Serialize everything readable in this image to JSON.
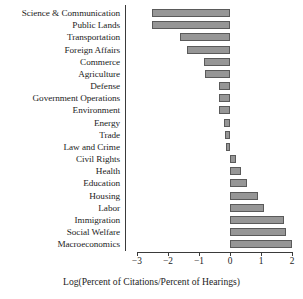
{
  "chart_data": {
    "type": "bar",
    "orientation": "horizontal",
    "title": "",
    "xlabel": "Log(Percent of Citations/Percent of Hearings)",
    "ylabel": "",
    "xlim": [
      -3.35,
      2.35
    ],
    "xticks": [
      -3,
      -2,
      -1,
      0,
      1,
      2
    ],
    "xtick_labels": [
      "−3",
      "−2",
      "−1",
      "0",
      "1",
      "2"
    ],
    "grid": false,
    "legend": null,
    "bar_color": "#969696",
    "bar_edge_color": "#5a5a5a",
    "axis_color": "#3a3a3a",
    "categories": [
      "Science & Communication",
      "Public Lands",
      "Transportation",
      "Foreign Affairs",
      "Commerce",
      "Agriculture",
      "Defense",
      "Government Operations",
      "Environment",
      "Energy",
      "Trade",
      "Law and Crime",
      "Civil Rights",
      "Health",
      "Education",
      "Housing",
      "Labor",
      "Immigration",
      "Social Welfare",
      "Macroeconomics"
    ],
    "values": [
      -2.5,
      -2.5,
      -1.6,
      -1.4,
      -0.85,
      -0.8,
      -0.35,
      -0.35,
      -0.35,
      -0.2,
      -0.17,
      -0.12,
      0.2,
      0.35,
      0.55,
      0.9,
      1.1,
      1.75,
      1.8,
      2.0
    ]
  }
}
